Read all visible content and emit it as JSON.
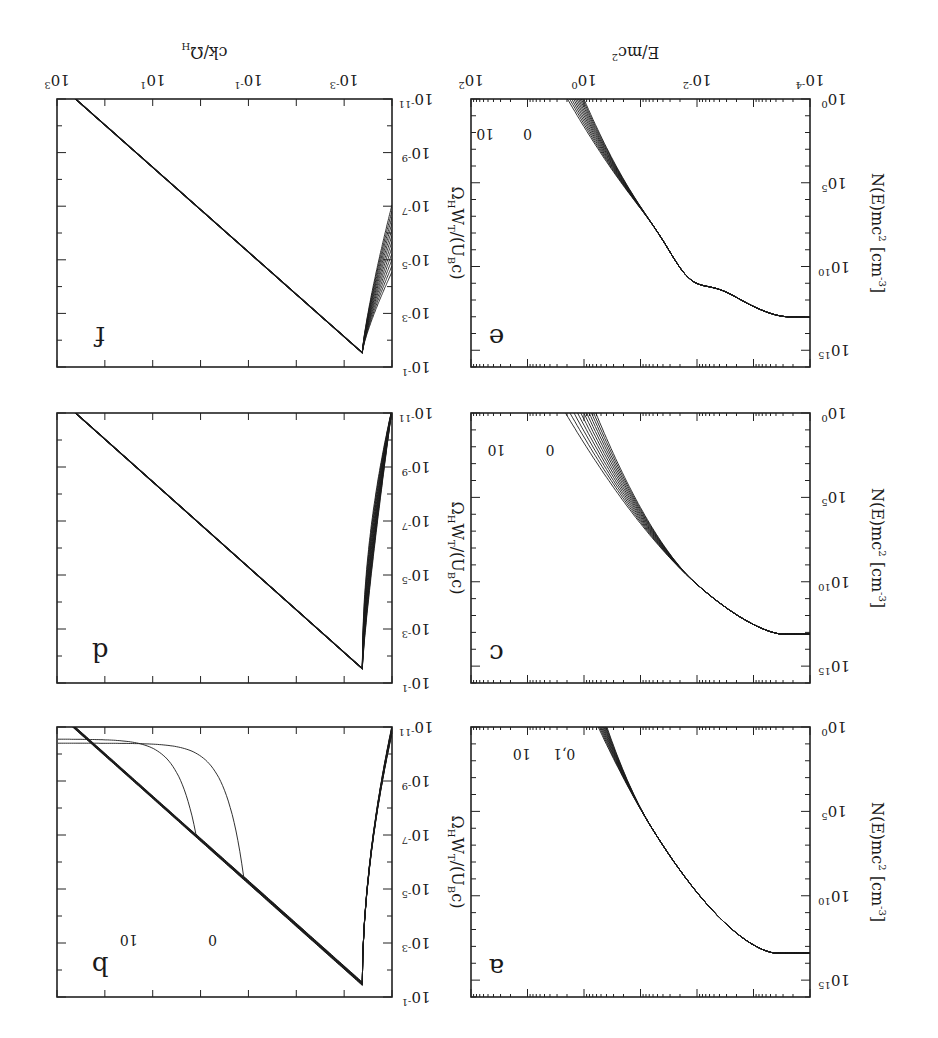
{
  "figure": {
    "orientation": "rotated 180 degrees",
    "panel_labels": [
      "a",
      "b",
      "c",
      "d",
      "e",
      "f"
    ],
    "left_column": {
      "ylabel": "N(E)mc² [cm⁻³]",
      "xlabel": "E/mc²",
      "yticks": [
        "10^0",
        "10^5",
        "10^10",
        "10^15"
      ],
      "xticks": [
        "10^-4",
        "10^-2",
        "10^0",
        "10^2"
      ]
    },
    "right_column": {
      "ylabel": "Ω_H W_T/(U_B c)",
      "xlabel": "ck/Ω_H",
      "yticks": [
        "10^-11",
        "10^-9",
        "10^-7",
        "10^-5",
        "10^-3",
        "10^-1"
      ],
      "xticks": [
        "10^-3",
        "10^-1",
        "10^1",
        "10^3"
      ]
    }
  },
  "labels": {
    "a_curve_first": "0,1",
    "a_curve_last": "10",
    "b_curve_first": "0",
    "b_curve_last": "10",
    "c_curve_first": "0",
    "c_curve_last": "10",
    "e_curve_first": "0",
    "e_curve_last": "10",
    "panel_a": "a",
    "panel_b": "b",
    "panel_c": "c",
    "panel_d": "d",
    "panel_e": "e",
    "panel_f": "f",
    "ylabel_left_main": "N(E)mc",
    "ylabel_left_sup1": "2",
    "ylabel_left_tail": " [cm",
    "ylabel_left_sup2": "-3",
    "ylabel_left_end": "]",
    "xlabel_left": "E/mc",
    "xlabel_left_sup": "2",
    "xlabel_right": "ck/Ω",
    "xlabel_right_sub": "H",
    "ylabel_right": "Ω",
    "ylabel_right_sub1": "H",
    "ylabel_right_mid": "W",
    "ylabel_right_sub2": "T",
    "ylabel_right_tail": "/(U",
    "ylabel_right_sub3": "B",
    "ylabel_right_end": "c)"
  },
  "chart_data": [
    {
      "panel": "a",
      "type": "line",
      "xlabel": "E/mc²",
      "ylabel": "N(E)mc² [cm⁻³]",
      "xscale": "log",
      "yscale": "log",
      "xlim": [
        0.0001,
        100
      ],
      "ylim": [
        1,
        1e+16
      ],
      "series_labels": [
        "0,1",
        "10"
      ],
      "n_curves": 11,
      "description": "Electron spectra: flat near 1e13 below E/mc²~1e-3, then steep power-law fall; curves fan out above ~1e-1 with time steps 0..10",
      "approx_points_first_curve": [
        [
          0.0001,
          30000000000000.0
        ],
        [
          0.001,
          25000000000000.0
        ],
        [
          0.01,
          1000000000000.0
        ],
        [
          0.1,
          1000000000.0
        ],
        [
          1,
          1000000.0
        ],
        [
          3,
          1
        ]
      ],
      "approx_points_last_curve": [
        [
          0.0001,
          30000000000000.0
        ],
        [
          0.001,
          25000000000000.0
        ],
        [
          0.01,
          1000000000000.0
        ],
        [
          0.1,
          300000000.0
        ],
        [
          0.5,
          100000.0
        ],
        [
          1.5,
          1
        ]
      ]
    },
    {
      "panel": "b",
      "type": "line",
      "xlabel": "ck/Ω_H",
      "ylabel": "Ω_H W_T/(U_B c)",
      "xscale": "log",
      "yscale": "log",
      "xlim": [
        0.0001,
        1000.0
      ],
      "ylim": [
        1e-11,
        0.1
      ],
      "series_labels": [
        "0",
        "10"
      ],
      "n_curves": 11,
      "description": "Turbulence spectra: rise from ~1e-11 at low k to peak ~3e-2 near ck/Ω_H≈3e-4, then k^-? power-law decay; early curves flatten at large k near 1e-11 ... curves 0 and 1 leave the power law at ck/Ω_H≈3e0 and 3e-1"
    },
    {
      "panel": "c",
      "type": "line",
      "xlabel": "E/mc²",
      "ylabel": "N(E)mc² [cm⁻³]",
      "xscale": "log",
      "yscale": "log",
      "xlim": [
        0.0001,
        100
      ],
      "ylim": [
        1,
        1e+16
      ],
      "series_labels": [
        "0",
        "10"
      ],
      "n_curves": 11,
      "description": "Flat at ~1e13 below 1e-3, steepening; curves diverge from ~1e-2, labels 0 (steepest) to 10 (hardest)"
    },
    {
      "panel": "d",
      "type": "line",
      "xlabel": "ck/Ω_H",
      "ylabel": "Ω_H W_T/(U_B c)",
      "xscale": "log",
      "yscale": "log",
      "xlim": [
        0.0001,
        1000.0
      ],
      "ylim": [
        1e-11,
        0.1
      ],
      "description": "Single power-law decay from peak ~3e-2 at ck/Ω_H≈3e-4 down to 1e-11 at ~3e2; steep rising branch at low k"
    },
    {
      "panel": "e",
      "type": "line",
      "xlabel": "E/mc²",
      "ylabel": "N(E)mc² [cm⁻³]",
      "xscale": "log",
      "yscale": "log",
      "xlim": [
        0.0001,
        100
      ],
      "ylim": [
        1,
        1e+16
      ],
      "series_labels": [
        "0",
        "10"
      ],
      "n_curves": 11,
      "description": "Flat ~1e13 below 1e-3, shoulder near 1e-2 (~1e10), then fan of curves from ~1e-1 labelled 0..10"
    },
    {
      "panel": "f",
      "type": "line",
      "xlabel": "ck/Ω_H",
      "ylabel": "Ω_H W_T/(U_B c)",
      "xscale": "log",
      "yscale": "log",
      "xlim": [
        0.0001,
        1000.0
      ],
      "ylim": [
        1e-11,
        0.1
      ],
      "description": "Power-law decay from peak ~3e-2 at ck/Ω_H≈3e-4 to ~1e-11 at ~3e2; thickened bundle of curves near low-k rise"
    }
  ]
}
